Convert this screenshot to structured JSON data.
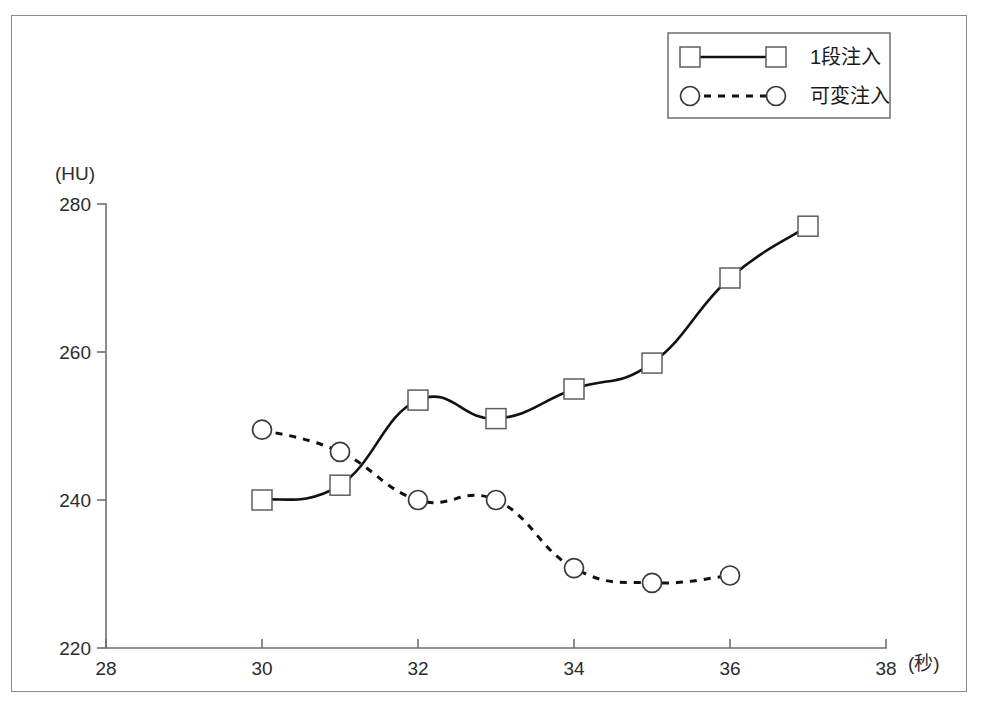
{
  "figure": {
    "frame": {
      "border_color": "#8a8a8a"
    },
    "legend": {
      "entries": [
        {
          "label": "1段注入",
          "marker": "square",
          "line_style": "solid"
        },
        {
          "label": "可変注入",
          "marker": "circle",
          "line_style": "dotted"
        }
      ]
    }
  },
  "chart_data": {
    "type": "line",
    "title": "",
    "xlabel": "(秒)",
    "ylabel": "(HU)",
    "xlim": [
      28,
      38
    ],
    "ylim": [
      220,
      280
    ],
    "xticks": [
      28,
      30,
      32,
      34,
      36,
      38
    ],
    "yticks": [
      220,
      240,
      260,
      280
    ],
    "xtick_labels": [
      "28",
      "30",
      "32",
      "34",
      "36",
      "38"
    ],
    "ytick_labels": [
      "220",
      "240",
      "260",
      "280"
    ],
    "grid": false,
    "legend_position": "top-right",
    "series": [
      {
        "name": "1段注入",
        "marker": "square",
        "line_style": "solid",
        "color": "#111111",
        "x": [
          30,
          31,
          32,
          33,
          34,
          35,
          36,
          37
        ],
        "values": [
          240,
          242,
          253.5,
          251,
          255,
          258.5,
          270,
          277
        ]
      },
      {
        "name": "可変注入",
        "marker": "circle",
        "line_style": "dotted",
        "color": "#111111",
        "x": [
          30,
          31,
          32,
          33,
          34,
          35,
          36
        ],
        "values": [
          249.5,
          246.5,
          240,
          240,
          230.8,
          228.8,
          229.8
        ]
      }
    ]
  }
}
